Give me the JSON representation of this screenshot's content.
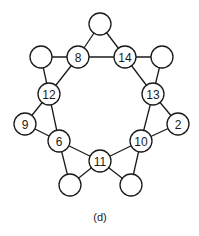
{
  "diagram": {
    "caption": "(d)",
    "node_radius": 11,
    "nodes": [
      {
        "id": "top",
        "label": "",
        "x": 100,
        "y": 24
      },
      {
        "id": "n8",
        "label": "8",
        "x": 78,
        "y": 57
      },
      {
        "id": "n14",
        "label": "14",
        "x": 125,
        "y": 57
      },
      {
        "id": "left-top",
        "label": "",
        "x": 41,
        "y": 57
      },
      {
        "id": "right-top",
        "label": "",
        "x": 162,
        "y": 57
      },
      {
        "id": "n12",
        "label": "12",
        "x": 49,
        "y": 94
      },
      {
        "id": "n13",
        "label": "13",
        "x": 153,
        "y": 94
      },
      {
        "id": "n9",
        "label": "9",
        "x": 25,
        "y": 124
      },
      {
        "id": "n2",
        "label": "2",
        "x": 178,
        "y": 124
      },
      {
        "id": "n6",
        "label": "6",
        "x": 59,
        "y": 141
      },
      {
        "id": "n10",
        "label": "10",
        "x": 141,
        "y": 141
      },
      {
        "id": "n11",
        "label": "11",
        "x": 100,
        "y": 161
      },
      {
        "id": "bottom-left",
        "label": "",
        "x": 70,
        "y": 185
      },
      {
        "id": "bottom-right",
        "label": "",
        "x": 131,
        "y": 185
      }
    ],
    "edges": [
      [
        "top",
        "n8"
      ],
      [
        "top",
        "n14"
      ],
      [
        "n8",
        "n14"
      ],
      [
        "left-top",
        "n8"
      ],
      [
        "left-top",
        "n12"
      ],
      [
        "n8",
        "n12"
      ],
      [
        "n14",
        "right-top"
      ],
      [
        "right-top",
        "n13"
      ],
      [
        "n14",
        "n13"
      ],
      [
        "n12",
        "n9"
      ],
      [
        "n12",
        "n6"
      ],
      [
        "n9",
        "n6"
      ],
      [
        "n13",
        "n2"
      ],
      [
        "n13",
        "n10"
      ],
      [
        "n2",
        "n10"
      ],
      [
        "n6",
        "n11"
      ],
      [
        "n6",
        "bottom-left"
      ],
      [
        "bottom-left",
        "n11"
      ],
      [
        "n10",
        "n11"
      ],
      [
        "n10",
        "bottom-right"
      ],
      [
        "bottom-right",
        "n11"
      ]
    ]
  }
}
